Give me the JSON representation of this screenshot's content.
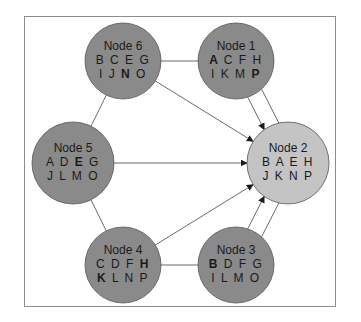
{
  "diagram": {
    "colors": {
      "node_fill": "#8a8a8a",
      "target_fill": "#c4c4c4",
      "node_stroke": "#555555",
      "edge": "#6a6a6a",
      "text": "#1a1a1a",
      "frame": "#8c8c8c"
    },
    "nodes": [
      {
        "id": "n6",
        "label": "Node 6",
        "row1": [
          {
            "t": "B",
            "b": false
          },
          {
            "t": "C",
            "b": false
          },
          {
            "t": "E",
            "b": false
          },
          {
            "t": "G",
            "b": false
          }
        ],
        "row2": [
          {
            "t": "I",
            "b": false
          },
          {
            "t": "J",
            "b": false
          },
          {
            "t": "N",
            "b": true
          },
          {
            "t": "O",
            "b": false
          }
        ],
        "cx": 123,
        "cy": 61,
        "r": 38,
        "target": false
      },
      {
        "id": "n1",
        "label": "Node 1",
        "row1": [
          {
            "t": "A",
            "b": true
          },
          {
            "t": "C",
            "b": false
          },
          {
            "t": "F",
            "b": false
          },
          {
            "t": "H",
            "b": false
          }
        ],
        "row2": [
          {
            "t": "I",
            "b": false
          },
          {
            "t": "K",
            "b": false
          },
          {
            "t": "M",
            "b": false
          },
          {
            "t": "P",
            "b": true
          }
        ],
        "cx": 236,
        "cy": 61,
        "r": 38,
        "target": false
      },
      {
        "id": "n5",
        "label": "Node 5",
        "row1": [
          {
            "t": "A",
            "b": false
          },
          {
            "t": "D",
            "b": false
          },
          {
            "t": "E",
            "b": true
          },
          {
            "t": "G",
            "b": false
          }
        ],
        "row2": [
          {
            "t": "J",
            "b": false
          },
          {
            "t": "L",
            "b": false
          },
          {
            "t": "M",
            "b": false
          },
          {
            "t": "O",
            "b": false
          }
        ],
        "cx": 73,
        "cy": 163,
        "r": 41,
        "target": false
      },
      {
        "id": "n2",
        "label": "Node 2",
        "row1": [
          {
            "t": "B",
            "b": false
          },
          {
            "t": "A",
            "b": false
          },
          {
            "t": "E",
            "b": false
          },
          {
            "t": "H",
            "b": false
          }
        ],
        "row2": [
          {
            "t": "J",
            "b": false
          },
          {
            "t": "K",
            "b": false
          },
          {
            "t": "N",
            "b": false
          },
          {
            "t": "P",
            "b": false
          }
        ],
        "cx": 288,
        "cy": 163,
        "r": 41,
        "target": true
      },
      {
        "id": "n4",
        "label": "Node 4",
        "row1": [
          {
            "t": "C",
            "b": false
          },
          {
            "t": "D",
            "b": false
          },
          {
            "t": "F",
            "b": false
          },
          {
            "t": "H",
            "b": true
          }
        ],
        "row2": [
          {
            "t": "K",
            "b": true
          },
          {
            "t": "L",
            "b": false
          },
          {
            "t": "N",
            "b": false
          },
          {
            "t": "P",
            "b": false
          }
        ],
        "cx": 123,
        "cy": 265,
        "r": 38,
        "target": false
      },
      {
        "id": "n3",
        "label": "Node 3",
        "row1": [
          {
            "t": "B",
            "b": true
          },
          {
            "t": "D",
            "b": false
          },
          {
            "t": "F",
            "b": false
          },
          {
            "t": "G",
            "b": false
          }
        ],
        "row2": [
          {
            "t": "I",
            "b": false
          },
          {
            "t": "L",
            "b": false
          },
          {
            "t": "M",
            "b": false
          },
          {
            "t": "O",
            "b": false
          }
        ],
        "cx": 236,
        "cy": 265,
        "r": 38,
        "target": false
      }
    ],
    "undirected_edges": [
      [
        "n6",
        "n1"
      ],
      [
        "n6",
        "n5"
      ],
      [
        "n5",
        "n4"
      ],
      [
        "n4",
        "n3"
      ],
      [
        "n1",
        "n2",
        "offset"
      ],
      [
        "n3",
        "n2",
        "offset"
      ]
    ],
    "directed_edges": [
      [
        "n1",
        "n2"
      ],
      [
        "n6",
        "n2"
      ],
      [
        "n5",
        "n2"
      ],
      [
        "n4",
        "n2"
      ],
      [
        "n3",
        "n2"
      ]
    ]
  }
}
